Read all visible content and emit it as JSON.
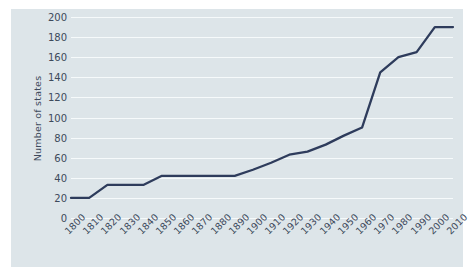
{
  "chart_data": {
    "type": "line",
    "title": "",
    "xlabel": "",
    "ylabel": "Number of states",
    "x": [
      1800,
      1810,
      1820,
      1830,
      1840,
      1850,
      1860,
      1870,
      1880,
      1890,
      1900,
      1910,
      1920,
      1930,
      1940,
      1950,
      1960,
      1970,
      1980,
      1990,
      2000,
      2010
    ],
    "values": [
      20,
      20,
      33,
      33,
      33,
      42,
      42,
      42,
      42,
      42,
      48,
      55,
      63,
      66,
      73,
      82,
      90,
      145,
      160,
      165,
      190,
      190
    ],
    "series": [
      {
        "name": "Number of states",
        "color": "#2e3c5c",
        "values": [
          20,
          20,
          33,
          33,
          33,
          42,
          42,
          42,
          42,
          42,
          48,
          55,
          63,
          66,
          73,
          82,
          90,
          145,
          160,
          165,
          190,
          190
        ]
      }
    ],
    "xtick_labels": [
      "1800",
      "1810",
      "1820",
      "1830",
      "1840",
      "1850",
      "1860",
      "1870",
      "1880",
      "1890",
      "1900",
      "1910",
      "1920",
      "1930",
      "1940",
      "1950",
      "1960",
      "1970",
      "1980",
      "1990",
      "2000",
      "2010"
    ],
    "ytick_labels": [
      "0",
      "20",
      "40",
      "60",
      "80",
      "100",
      "120",
      "140",
      "160",
      "180",
      "200"
    ],
    "yticks": [
      0,
      20,
      40,
      60,
      80,
      100,
      120,
      140,
      160,
      180,
      200
    ],
    "ylim": [
      0,
      205
    ],
    "xlim": [
      1800,
      2010
    ],
    "grid": "horizontal",
    "legend": "none",
    "colors": {
      "panel_background": "#dde5e9",
      "gridline": "#f6fafb",
      "line": "#2e3c5c",
      "tick_text": "#3d4a5c",
      "figure_background": "#ffffff"
    }
  }
}
